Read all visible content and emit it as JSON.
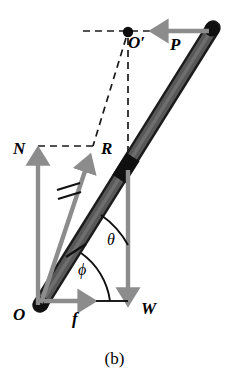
{
  "figure": {
    "caption": "(b)",
    "kind": "free-body force diagram of a leaning rod",
    "colors": {
      "rod_fill": "#555555",
      "rod_edge": "#1a1a1a",
      "rod_cap": "#111111",
      "vector_gray": "#8c8c8c",
      "line_black": "#000000",
      "background": "#ffffff"
    },
    "labels": {
      "origin": "O",
      "pivot_prime": "O′",
      "force_P": "P",
      "force_N": "N",
      "force_R": "R",
      "force_W": "W",
      "force_f": "f",
      "angle_theta": "θ",
      "angle_phi": "ϕ"
    },
    "vectors": [
      {
        "name": "N",
        "label": "N",
        "meaning": "normal force",
        "direction": "up",
        "color": "#8c8c8c",
        "from": [
          38,
          305
        ],
        "to": [
          38,
          148
        ]
      },
      {
        "name": "f",
        "label": "f",
        "meaning": "friction force",
        "direction": "right",
        "color": "#8c8c8c",
        "from": [
          41,
          301
        ],
        "to": [
          96,
          301
        ]
      },
      {
        "name": "R",
        "label": "R",
        "meaning": "resultant reaction",
        "direction": "up-right",
        "color": "#8c8c8c",
        "from": [
          40,
          304
        ],
        "to": [
          92,
          150
        ]
      },
      {
        "name": "W",
        "label": "W",
        "meaning": "weight",
        "direction": "down",
        "color": "#8c8c8c",
        "from": [
          128,
          170
        ],
        "to": [
          128,
          307
        ]
      },
      {
        "name": "P",
        "label": "P",
        "meaning": "applied horizontal force",
        "direction": "left",
        "color": "#8c8c8c",
        "from": [
          209,
          31
        ],
        "to": [
          150,
          31
        ]
      }
    ],
    "points": [
      {
        "name": "O",
        "label": "O",
        "at": [
          40,
          305
        ],
        "meaning": "contact point at ground"
      },
      {
        "name": "O'",
        "label": "O′",
        "at": [
          128,
          32
        ],
        "meaning": "instantaneous center"
      }
    ],
    "angles": [
      {
        "name": "theta",
        "label": "θ",
        "meaning": "angle of rod from horizontal",
        "at": [
          112,
          243
        ]
      },
      {
        "name": "phi",
        "label": "ϕ",
        "meaning": "angle of resultant R from horizontal",
        "at": [
          85,
          270
        ]
      }
    ],
    "dashed_lines": [
      {
        "name": "horizontal-top",
        "from": [
          83,
          31
        ],
        "to": [
          213,
          31
        ]
      },
      {
        "name": "vertical-from-Oprime",
        "from": [
          128,
          36
        ],
        "to": [
          128,
          168
        ]
      },
      {
        "name": "diagonal-Oprime-to-R",
        "from": [
          126,
          36
        ],
        "to": [
          92,
          147
        ]
      },
      {
        "name": "horizontal-N-to-R",
        "from": [
          38,
          146
        ],
        "to": [
          93,
          146
        ]
      }
    ],
    "rod": {
      "name": "rod",
      "from": [
        40,
        305
      ],
      "to": [
        213,
        28
      ],
      "width": 13,
      "center_band_at": [
        126,
        168
      ],
      "tick_mark_at": [
        76,
        250
      ]
    },
    "tick_marks": {
      "double_hash_on_R": [
        68,
        192
      ],
      "single_hash_on_rod": [
        76,
        250
      ]
    }
  }
}
